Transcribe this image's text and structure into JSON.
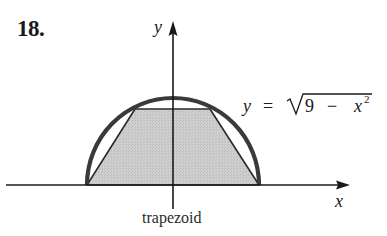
{
  "problem": {
    "number": "18."
  },
  "axes": {
    "x_label": "x",
    "y_label": "y"
  },
  "curve": {
    "equation_lhs": "y",
    "equation_eq": "=",
    "equation_radicand_a": "9",
    "equation_minus": "−",
    "equation_radicand_var": "x",
    "equation_exponent": "2",
    "description": "upper semicircle of radius 3"
  },
  "shape": {
    "caption": "trapezoid",
    "fill": "#c8c8c8",
    "stroke": "#2a2a2a"
  },
  "colors": {
    "curve": "#3a3a3a",
    "axis": "#1a1a1a",
    "text": "#1a1a1a"
  }
}
